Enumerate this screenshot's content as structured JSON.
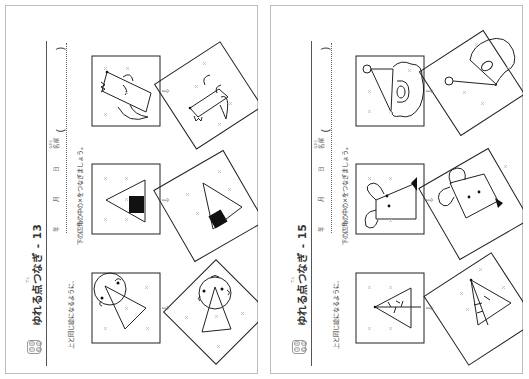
{
  "pages": [
    {
      "title": "ゆれる点つなぎ - 13",
      "title_ruby": "てん",
      "instruction_line1": "上と同じ絵になるように、",
      "instruction_line2": "下の四角の中の×をつなぎましょう。",
      "instruction_ruby_1": "うえ おな え",
      "instruction_ruby_2": "した しかく なか",
      "header": {
        "year": "年",
        "month": "月",
        "day": "日",
        "name": "名前",
        "name_ruby": "なまえ",
        "open_paren": "(",
        "close_paren": ")"
      },
      "logo_chars": [
        "ち",
        "え",
        "ね",
        "ん"
      ],
      "arrow": "⇨",
      "puzzles": [
        {
          "subject": "dog (rectangle with ears and tail)"
        },
        {
          "subject": "onigiri (triangle with black square)"
        },
        {
          "subject": "clown face (circle with triangle hat)"
        }
      ]
    },
    {
      "title": "ゆれる点つなぎ - 15",
      "title_ruby": "てん",
      "instruction_line1": "上と同じ絵になるように、",
      "instruction_line2": "下の四角の中の×をつなぎましょう。",
      "instruction_ruby_1": "うえ おな え",
      "instruction_ruby_2": "した しかく なか",
      "header": {
        "year": "年",
        "month": "月",
        "day": "日",
        "name": "名前",
        "name_ruby": "なまえ",
        "open_paren": "(",
        "close_paren": ")"
      },
      "logo_chars": [
        "ち",
        "え",
        "ね",
        "ん"
      ],
      "arrow": "⇨",
      "puzzles": [
        {
          "subject": "santa hat with beard"
        },
        {
          "subject": "mouse (rectangle with round ears)"
        },
        {
          "subject": "tree (triangle with trunk line)"
        }
      ]
    }
  ]
}
